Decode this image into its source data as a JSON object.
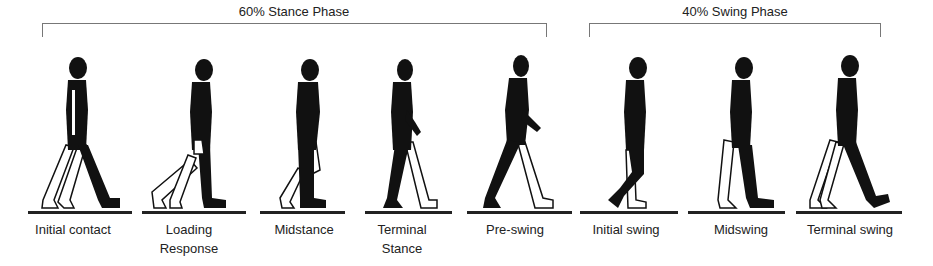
{
  "phases": [
    {
      "label": "60% Stance Phase",
      "center_x": 294,
      "bracket_left": 42,
      "bracket_right": 546
    },
    {
      "label": "40% Swing Phase",
      "center_x": 735,
      "bracket_left": 589,
      "bracket_right": 880
    }
  ],
  "frames": [
    {
      "caption_line1": "Initial contact",
      "caption_line2": "",
      "center_x": 73,
      "ground_left": 28,
      "ground_right": 132
    },
    {
      "caption_line1": "Loading",
      "caption_line2": "Response",
      "center_x": 189,
      "ground_left": 142,
      "ground_right": 246
    },
    {
      "caption_line1": "Midstance",
      "caption_line2": "",
      "center_x": 304,
      "ground_left": 260,
      "ground_right": 345
    },
    {
      "caption_line1": "Terminal",
      "caption_line2": "Stance",
      "center_x": 402,
      "ground_left": 365,
      "ground_right": 452
    },
    {
      "caption_line1": "Pre-swing",
      "caption_line2": "",
      "center_x": 515,
      "ground_left": 467,
      "ground_right": 572
    },
    {
      "caption_line1": "Initial swing",
      "caption_line2": "",
      "center_x": 626,
      "ground_left": 580,
      "ground_right": 678
    },
    {
      "caption_line1": "Midswing",
      "caption_line2": "",
      "center_x": 741,
      "ground_left": 688,
      "ground_right": 785
    },
    {
      "caption_line1": "Terminal swing",
      "caption_line2": "",
      "center_x": 850,
      "ground_left": 796,
      "ground_right": 902
    }
  ],
  "colors": {
    "silhouette": "#111111",
    "outline_leg": "#111111",
    "ground": "#222222",
    "bracket": "#777777"
  }
}
